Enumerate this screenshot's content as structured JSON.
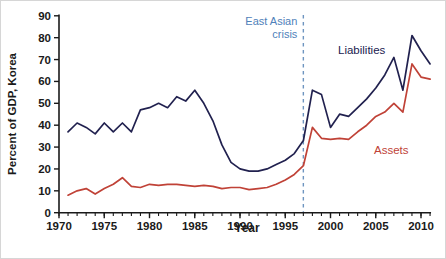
{
  "chart_data": {
    "type": "line",
    "title": "",
    "xlabel": "Year",
    "ylabel": "Percent of GDP, Korea",
    "xlim": [
      1970,
      2011.5
    ],
    "ylim": [
      0,
      90
    ],
    "grid": false,
    "legend_position": "inline-labels",
    "x_major_ticks": [
      1970,
      1975,
      1980,
      1985,
      1990,
      1995,
      2000,
      2005,
      2010
    ],
    "y_ticks": [
      0,
      10,
      20,
      30,
      40,
      50,
      60,
      70,
      80,
      90
    ],
    "x": [
      1971,
      1972,
      1973,
      1974,
      1975,
      1976,
      1977,
      1978,
      1979,
      1980,
      1981,
      1982,
      1983,
      1984,
      1985,
      1986,
      1987,
      1988,
      1989,
      1990,
      1991,
      1992,
      1993,
      1994,
      1995,
      1996,
      1997,
      1998,
      1999,
      2000,
      2001,
      2002,
      2003,
      2004,
      2005,
      2006,
      2007,
      2008,
      2009,
      2010,
      2011
    ],
    "series": [
      {
        "name": "Liabilities",
        "color": "#21214f",
        "values": [
          37,
          41,
          39,
          36,
          41,
          37,
          41,
          37,
          47,
          48,
          50,
          48,
          53,
          51,
          56,
          50,
          42,
          31,
          23,
          20,
          19,
          19,
          20,
          22,
          24,
          27,
          33,
          56,
          54,
          39,
          45,
          44,
          48,
          52,
          57,
          63,
          71,
          56,
          81,
          74,
          68
        ]
      },
      {
        "name": "Assets",
        "color": "#c04237",
        "values": [
          8,
          10,
          11,
          8.5,
          11,
          13,
          16,
          12,
          11.5,
          13,
          12.5,
          13,
          13,
          12.5,
          12,
          12.5,
          12,
          11,
          11.5,
          11.5,
          10.5,
          11,
          11.5,
          13,
          15,
          17.5,
          21.5,
          39,
          34,
          33.5,
          34,
          33.5,
          37,
          40,
          44,
          46,
          50,
          46,
          68,
          62,
          61
        ]
      }
    ],
    "annotation": {
      "label_line1": "East Asian",
      "label_line2": "crisis",
      "x": 1997,
      "text_color": "#4f81ba",
      "line_color": "#6e95c0",
      "line_style": "dashed"
    },
    "axis_color": "#1a1a1a",
    "series_label_liabilities": "Liabilities",
    "series_label_assets": "Assets"
  }
}
